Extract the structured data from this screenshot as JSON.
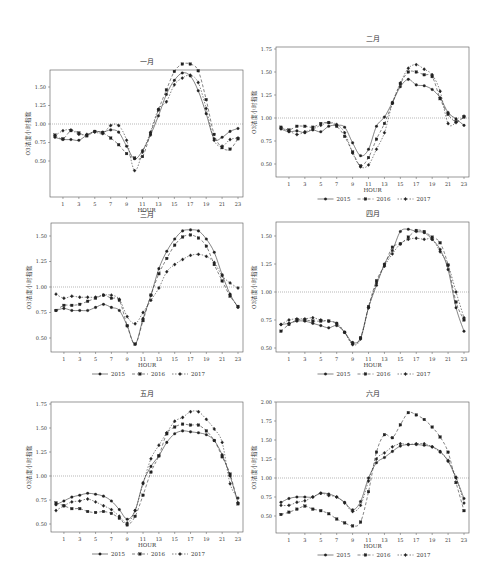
{
  "figure": {
    "y_axis_label": "O3浓度小时指数",
    "x_axis_label": "HOUR",
    "legend": [
      "2015",
      "2016",
      "2017"
    ],
    "x_ticks": [
      1,
      3,
      5,
      7,
      9,
      11,
      13,
      15,
      17,
      19,
      21,
      23
    ],
    "reference_line": 1.0
  },
  "chart_data": [
    {
      "type": "line",
      "title": "一月",
      "xlabel": "HOUR",
      "ylabel": "O3浓度小时指数",
      "ylim": [
        0.25,
        2.0
      ],
      "yticks": [
        "0.50",
        "0.75",
        "1.00",
        "1.25",
        "1.50",
        "1.75",
        "2.00"
      ],
      "x": [
        0,
        1,
        2,
        3,
        4,
        5,
        6,
        7,
        8,
        9,
        10,
        11,
        12,
        13,
        14,
        15,
        16,
        17,
        18,
        19,
        20,
        21,
        22,
        23
      ],
      "reference_line": 1.0,
      "legend_position": "bottom",
      "series": [
        {
          "name": "2015",
          "values": [
            0.82,
            0.79,
            0.79,
            0.78,
            0.85,
            0.9,
            0.89,
            0.92,
            0.89,
            0.7,
            0.53,
            0.64,
            0.85,
            1.11,
            1.4,
            1.59,
            1.69,
            1.65,
            1.45,
            1.14,
            0.8,
            0.82,
            0.9,
            0.94
          ]
        },
        {
          "name": "2016",
          "values": [
            0.85,
            0.8,
            0.91,
            0.88,
            0.84,
            0.9,
            0.88,
            0.81,
            0.72,
            0.6,
            0.54,
            0.56,
            0.87,
            1.19,
            1.46,
            1.71,
            1.81,
            1.81,
            1.72,
            1.33,
            0.86,
            0.68,
            0.66,
            0.8
          ]
        },
        {
          "name": "2017",
          "values": [
            0.84,
            0.91,
            0.92,
            0.86,
            0.86,
            0.89,
            0.87,
            0.98,
            0.98,
            0.78,
            0.37,
            0.62,
            0.89,
            1.2,
            1.3,
            1.53,
            1.62,
            1.66,
            1.56,
            1.21,
            0.78,
            0.7,
            0.79,
            0.81
          ]
        }
      ]
    },
    {
      "type": "line",
      "title": "二月",
      "xlabel": "HOUR",
      "ylabel": "O3浓度小时指数",
      "ylim": [
        0.4,
        1.75
      ],
      "yticks": [
        "0.50",
        "0.75",
        "1.00",
        "1.25",
        "1.50",
        "1.75"
      ],
      "x": [
        0,
        1,
        2,
        3,
        4,
        5,
        6,
        7,
        8,
        9,
        10,
        11,
        12,
        13,
        14,
        15,
        16,
        17,
        18,
        19,
        20,
        21,
        22,
        23
      ],
      "reference_line": 1.0,
      "legend_position": "bottom",
      "series": [
        {
          "name": "2015",
          "values": [
            0.88,
            0.85,
            0.86,
            0.84,
            0.87,
            0.85,
            0.91,
            0.92,
            0.9,
            0.73,
            0.59,
            0.66,
            0.91,
            1.01,
            1.17,
            1.34,
            1.42,
            1.36,
            1.35,
            1.31,
            1.22,
            1.06,
            0.99,
            0.92
          ]
        },
        {
          "name": "2016",
          "values": [
            0.9,
            0.87,
            0.91,
            0.91,
            0.9,
            0.94,
            0.95,
            0.91,
            0.8,
            0.63,
            0.48,
            0.57,
            0.77,
            0.94,
            1.16,
            1.37,
            1.5,
            1.5,
            1.47,
            1.45,
            1.21,
            1.04,
            0.96,
            1.01
          ]
        },
        {
          "name": "2017",
          "values": [
            0.89,
            0.86,
            0.82,
            0.85,
            0.88,
            0.92,
            0.95,
            0.93,
            0.84,
            0.62,
            0.47,
            0.49,
            0.66,
            0.84,
            1.16,
            1.38,
            1.54,
            1.58,
            1.53,
            1.47,
            1.29,
            0.94,
            0.95,
            1.02
          ]
        }
      ]
    },
    {
      "type": "line",
      "title": "三月",
      "xlabel": "HOUR",
      "ylabel": "O3浓度小时指数",
      "ylim": [
        0.35,
        1.65
      ],
      "yticks": [
        "0.50",
        "0.75",
        "1.00",
        "1.25",
        "1.50"
      ],
      "x": [
        0,
        1,
        2,
        3,
        4,
        5,
        6,
        7,
        8,
        9,
        10,
        11,
        12,
        13,
        14,
        15,
        16,
        17,
        18,
        19,
        20,
        21,
        22,
        23
      ],
      "reference_line": 1.0,
      "legend_position": "bottom",
      "series": [
        {
          "name": "2015",
          "values": [
            0.77,
            0.79,
            0.77,
            0.77,
            0.77,
            0.8,
            0.83,
            0.8,
            0.77,
            0.62,
            0.44,
            0.69,
            0.92,
            1.18,
            1.35,
            1.47,
            1.55,
            1.56,
            1.55,
            1.47,
            1.34,
            1.12,
            0.93,
            0.8
          ]
        },
        {
          "name": "2016",
          "values": [
            0.77,
            0.82,
            0.82,
            0.83,
            0.86,
            0.89,
            0.92,
            0.89,
            0.87,
            0.62,
            0.44,
            0.67,
            0.92,
            1.13,
            1.28,
            1.41,
            1.49,
            1.51,
            1.48,
            1.4,
            1.22,
            1.06,
            0.91,
            0.81
          ]
        },
        {
          "name": "2017",
          "values": [
            0.93,
            0.89,
            0.91,
            0.9,
            0.9,
            0.9,
            0.92,
            0.92,
            0.88,
            0.71,
            0.64,
            0.75,
            0.87,
            0.99,
            1.15,
            1.22,
            1.27,
            1.31,
            1.32,
            1.3,
            1.24,
            1.11,
            1.04,
            0.99
          ]
        }
      ]
    },
    {
      "type": "line",
      "title": "四月",
      "xlabel": "HOUR",
      "ylabel": "O3浓度小时指数",
      "ylim": [
        0.48,
        1.62
      ],
      "yticks": [
        "0.50",
        "0.75",
        "1.00",
        "1.25",
        "1.50"
      ],
      "x": [
        0,
        1,
        2,
        3,
        4,
        5,
        6,
        7,
        8,
        9,
        10,
        11,
        12,
        13,
        14,
        15,
        16,
        17,
        18,
        19,
        20,
        21,
        22,
        23
      ],
      "reference_line": 1.0,
      "legend_position": "bottom",
      "series": [
        {
          "name": "2015",
          "values": [
            0.71,
            0.72,
            0.74,
            0.74,
            0.72,
            0.7,
            0.68,
            0.7,
            0.64,
            0.55,
            0.59,
            0.86,
            1.06,
            1.25,
            1.37,
            1.54,
            1.56,
            1.54,
            1.53,
            1.47,
            1.38,
            1.2,
            0.86,
            0.65
          ]
        },
        {
          "name": "2016",
          "values": [
            0.65,
            0.71,
            0.75,
            0.75,
            0.74,
            0.74,
            0.74,
            0.72,
            0.64,
            0.54,
            0.59,
            0.87,
            1.1,
            1.24,
            1.4,
            1.43,
            1.49,
            1.55,
            1.54,
            1.49,
            1.44,
            1.24,
            0.91,
            0.75
          ]
        },
        {
          "name": "2017",
          "values": [
            0.71,
            0.75,
            0.76,
            0.76,
            0.77,
            0.75,
            0.74,
            0.72,
            0.64,
            0.53,
            0.58,
            0.86,
            1.08,
            1.23,
            1.34,
            1.43,
            1.47,
            1.48,
            1.47,
            1.47,
            1.36,
            1.24,
            1.0,
            0.77
          ]
        }
      ]
    },
    {
      "type": "line",
      "title": "五月",
      "xlabel": "HOUR",
      "ylabel": "O3浓度小时指数",
      "ylim": [
        0.42,
        1.75
      ],
      "yticks": [
        "0.50",
        "0.75",
        "1.00",
        "1.25",
        "1.50",
        "1.75"
      ],
      "x": [
        0,
        1,
        2,
        3,
        4,
        5,
        6,
        7,
        8,
        9,
        10,
        11,
        12,
        13,
        14,
        15,
        16,
        17,
        18,
        19,
        20,
        21,
        22,
        23
      ],
      "reference_line": 1.0,
      "legend_position": "bottom",
      "series": [
        {
          "name": "2015",
          "values": [
            0.7,
            0.74,
            0.78,
            0.8,
            0.82,
            0.81,
            0.79,
            0.74,
            0.65,
            0.55,
            0.64,
            0.93,
            1.1,
            1.21,
            1.35,
            1.44,
            1.47,
            1.46,
            1.45,
            1.43,
            1.37,
            1.22,
            1.0,
            0.72
          ]
        },
        {
          "name": "2016",
          "values": [
            0.72,
            0.69,
            0.66,
            0.66,
            0.63,
            0.62,
            0.63,
            0.61,
            0.56,
            0.49,
            0.58,
            0.8,
            1.04,
            1.21,
            1.44,
            1.51,
            1.54,
            1.53,
            1.53,
            1.47,
            1.37,
            1.2,
            1.02,
            0.71
          ]
        },
        {
          "name": "2017",
          "values": [
            0.64,
            0.69,
            0.73,
            0.74,
            0.76,
            0.73,
            0.69,
            0.65,
            0.58,
            0.51,
            0.64,
            0.92,
            1.18,
            1.32,
            1.45,
            1.57,
            1.61,
            1.67,
            1.67,
            1.59,
            1.49,
            1.35,
            0.92,
            0.77
          ]
        }
      ]
    },
    {
      "type": "line",
      "title": "六月",
      "xlabel": "HOUR",
      "ylabel": "O3浓度小时指数",
      "ylim": [
        0.3,
        2.0
      ],
      "yticks": [
        "0.50",
        "0.75",
        "1.00",
        "1.25",
        "1.50",
        "1.75",
        "2.00"
      ],
      "x": [
        0,
        1,
        2,
        3,
        4,
        5,
        6,
        7,
        8,
        9,
        10,
        11,
        12,
        13,
        14,
        15,
        16,
        17,
        18,
        19,
        20,
        21,
        22,
        23
      ],
      "reference_line": 1.0,
      "legend_position": "bottom",
      "series": [
        {
          "name": "2015",
          "values": [
            0.68,
            0.73,
            0.75,
            0.75,
            0.75,
            0.8,
            0.79,
            0.75,
            0.68,
            0.58,
            0.69,
            1.0,
            1.2,
            1.27,
            1.35,
            1.42,
            1.44,
            1.44,
            1.43,
            1.41,
            1.35,
            1.22,
            1.0,
            0.73
          ]
        },
        {
          "name": "2016",
          "values": [
            0.52,
            0.55,
            0.59,
            0.63,
            0.59,
            0.57,
            0.53,
            0.46,
            0.41,
            0.37,
            0.42,
            0.82,
            1.34,
            1.57,
            1.53,
            1.7,
            1.86,
            1.83,
            1.77,
            1.67,
            1.54,
            1.34,
            0.94,
            0.57
          ]
        },
        {
          "name": "2017",
          "values": [
            0.64,
            0.64,
            0.68,
            0.7,
            0.75,
            0.8,
            0.77,
            0.75,
            0.67,
            0.56,
            0.64,
            0.96,
            1.25,
            1.33,
            1.41,
            1.45,
            1.44,
            1.45,
            1.45,
            1.41,
            1.34,
            1.23,
            1.01,
            0.67
          ]
        }
      ]
    }
  ]
}
